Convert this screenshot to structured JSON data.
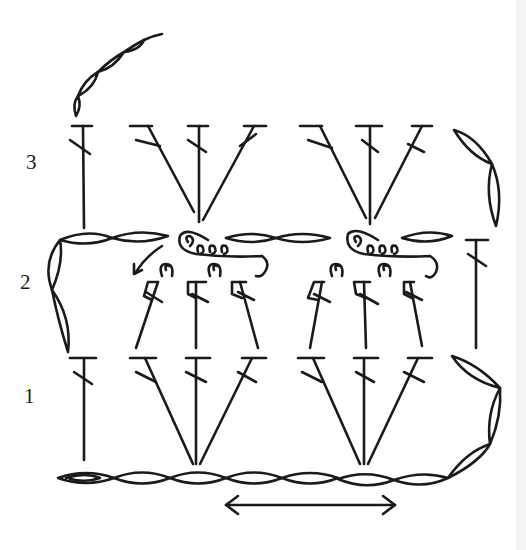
{
  "diagram": {
    "ink_color": "#1a1a1a",
    "background": "#ffffff",
    "row_labels": [
      {
        "label": "3",
        "x": 26,
        "y": 152
      },
      {
        "label": "2",
        "x": 20,
        "y": 272
      },
      {
        "label": "1",
        "x": 24,
        "y": 386
      }
    ],
    "foundation_chain": {
      "y": 478,
      "x_start": 58,
      "x_end": 448,
      "stitch_count": 7,
      "symbol": "chain"
    },
    "direction_arrow": {
      "x1": 226,
      "x2": 395,
      "y": 505,
      "symbol": "double-arrow"
    },
    "rows": [
      {
        "number": 1,
        "symbol": "double-crochet",
        "groups": [
          {
            "type": "single",
            "x": 84
          },
          {
            "type": "fan",
            "base_x": 193,
            "tops": [
              145,
              197,
              252
            ]
          },
          {
            "type": "fan",
            "base_x": 363,
            "tops": [
              313,
              365,
              418
            ]
          }
        ],
        "turning_chain": "right",
        "top_y": 357,
        "bottom_y": 460
      },
      {
        "number": 2,
        "symbol": "post-stitch",
        "groups": [
          {
            "type": "post-group",
            "xs": [
              150,
              195,
              242
            ]
          },
          {
            "type": "post-group",
            "xs": [
              320,
              365,
              413
            ]
          },
          {
            "type": "single",
            "x": 476
          }
        ],
        "turning_chain": "left",
        "top_y": 240
      },
      {
        "number": 3,
        "symbol": "double-crochet",
        "groups": [
          {
            "type": "single",
            "x": 83
          },
          {
            "type": "fan",
            "base_x": 200,
            "tops": [
              148,
              199,
              253
            ]
          },
          {
            "type": "fan",
            "base_x": 370,
            "tops": [
              314,
              370,
              422
            ]
          }
        ],
        "turning_chain": "right",
        "top_y": 126,
        "bottom_y": 224
      }
    ],
    "top_chain": {
      "symbol": "chain",
      "stitch_count": 4
    }
  }
}
